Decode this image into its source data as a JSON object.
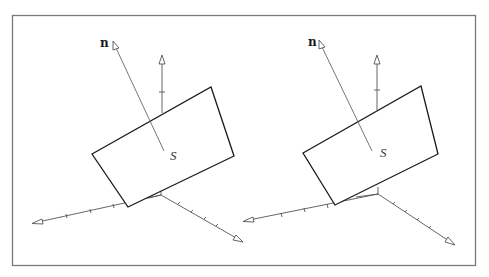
{
  "figure": {
    "panels": [
      {
        "id": "left",
        "normal_label": "n",
        "surface_label": "S"
      },
      {
        "id": "right",
        "normal_label": "n",
        "surface_label": "S"
      }
    ],
    "colors": {
      "frame": "#7a7a7a",
      "surface_edge": "#1a1a1a",
      "axes": "#555555",
      "background": "#ffffff"
    }
  }
}
